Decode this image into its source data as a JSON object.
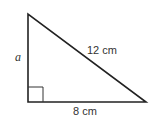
{
  "diagram": {
    "type": "right-triangle",
    "vertices": {
      "top": [
        28,
        14
      ],
      "right_angle": [
        28,
        102
      ],
      "bottom_right": [
        146,
        102
      ]
    },
    "right_angle_marker_size": 15,
    "stroke_color": "#222222",
    "labels": {
      "vertical_side": "a",
      "hypotenuse": "12 cm",
      "base": "8 cm"
    }
  }
}
